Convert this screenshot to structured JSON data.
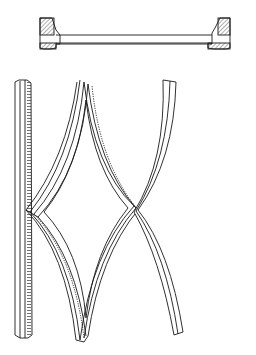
{
  "diagram": {
    "background": "#ffffff",
    "stroke_color": "#1a1a1a",
    "hatch_color": "#333333",
    "parts": [
      {
        "id": "cross-section",
        "label": "",
        "region": "top"
      },
      {
        "id": "straight-stile",
        "label": "",
        "region": "bottom-left"
      },
      {
        "id": "diamond-bars",
        "label": "",
        "region": "bottom-center"
      },
      {
        "id": "curved-bar",
        "label": "",
        "region": "bottom-right"
      }
    ]
  }
}
